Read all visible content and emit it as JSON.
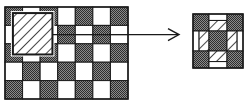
{
  "figure": {
    "colors": {
      "background": "#ffffff",
      "dark_cell": "#5a5a5a",
      "light_cell": "#ffffff",
      "stroke": "#1a1a1a",
      "hatch": "#1a1a1a"
    },
    "source_grid": {
      "rows": 5,
      "cols": 7,
      "cells": [
        [
          "dark",
          "light",
          "dark",
          "light",
          "dark",
          "light",
          "dark"
        ],
        [
          "light",
          "dark",
          "light",
          "split",
          "split",
          "split",
          "split"
        ],
        [
          "dark",
          "light",
          "dark",
          "light",
          "dark",
          "light",
          "dark"
        ],
        [
          "light",
          "dark",
          "light",
          "dark",
          "light",
          "dark",
          "light"
        ],
        [
          "dark",
          "light",
          "dark",
          "light",
          "dark",
          "light",
          "dark"
        ]
      ],
      "split_row_cells": [
        "dark",
        "light",
        "dark",
        "light"
      ],
      "highlight_window": {
        "label": "hatched-window",
        "covers_rows": [
          1,
          3
        ],
        "covers_cols": [
          2,
          3
        ]
      }
    },
    "arrow": {
      "direction": "right",
      "from": "source_grid",
      "to": "result_pattern"
    },
    "result_pattern": {
      "layout": [
        [
          "dark",
          "edge-top",
          "dark"
        ],
        [
          "edge-left",
          "dark",
          "edge-right"
        ],
        [
          "dark",
          "edge-bottom",
          "dark"
        ]
      ],
      "edge_fill": [
        "light",
        "hatched"
      ]
    }
  }
}
